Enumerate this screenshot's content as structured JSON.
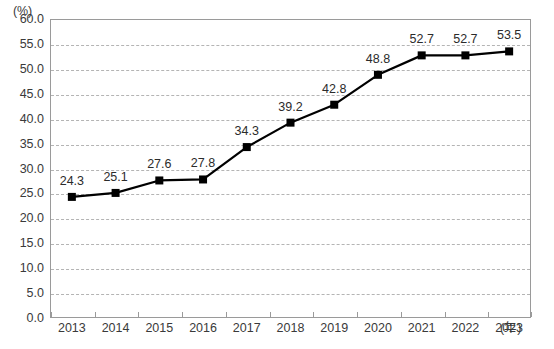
{
  "chart_data": {
    "type": "line",
    "title": "",
    "xlabel": "(年)",
    "ylabel": "(%)",
    "categories": [
      "2013",
      "2014",
      "2015",
      "2016",
      "2017",
      "2018",
      "2019",
      "2020",
      "2021",
      "2022",
      "2023"
    ],
    "values": [
      24.3,
      25.1,
      27.6,
      27.8,
      34.3,
      39.2,
      42.8,
      48.8,
      52.7,
      52.7,
      53.5
    ],
    "point_labels": [
      "24.3",
      "25.1",
      "27.6",
      "27.8",
      "34.3",
      "39.2",
      "42.8",
      "48.8",
      "52.7",
      "52.7",
      "53.5"
    ],
    "ylim": [
      0,
      60
    ],
    "ytick_step": 5,
    "ytick_labels": [
      "60.0",
      "55.0",
      "50.0",
      "45.0",
      "40.0",
      "35.0",
      "30.0",
      "25.0",
      "20.0",
      "15.0",
      "10.0",
      "5.0",
      "0.0"
    ],
    "ytick_values": [
      60,
      55,
      50,
      45,
      40,
      35,
      30,
      25,
      20,
      15,
      10,
      5,
      0
    ],
    "grid": true,
    "grid_style": "dashed",
    "legend": null,
    "series_color": "#000000",
    "marker": "square",
    "grid_color": "#b4b4b4",
    "frame_color": "#9a9a9a",
    "text_color": "#3a3a3a"
  }
}
